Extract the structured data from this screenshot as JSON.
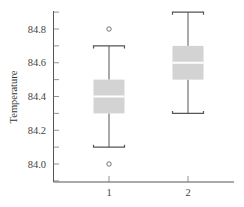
{
  "chart_data": {
    "type": "boxplot",
    "title": "",
    "xlabel": "",
    "ylabel": "Temperature",
    "categories": [
      "1",
      "2"
    ],
    "ylim": [
      83.87,
      84.95
    ],
    "yticks": [
      "84.0",
      "84.2",
      "84.4",
      "84.6",
      "84.8"
    ],
    "grid": false,
    "boxes": [
      {
        "name": "1",
        "whisker_low": 84.1,
        "q1": 84.3,
        "median": 84.4,
        "q3": 84.5,
        "whisker_high": 84.7,
        "outliers": [
          84.0,
          84.8
        ]
      },
      {
        "name": "2",
        "whisker_low": 84.3,
        "q1": 84.5,
        "median": 84.6,
        "q3": 84.7,
        "whisker_high": 84.9,
        "outliers": []
      }
    ],
    "colors": {
      "box_fill": "#d3d3d3",
      "median": "#ffffff",
      "lines": "#555555",
      "axis": "#555555"
    }
  }
}
